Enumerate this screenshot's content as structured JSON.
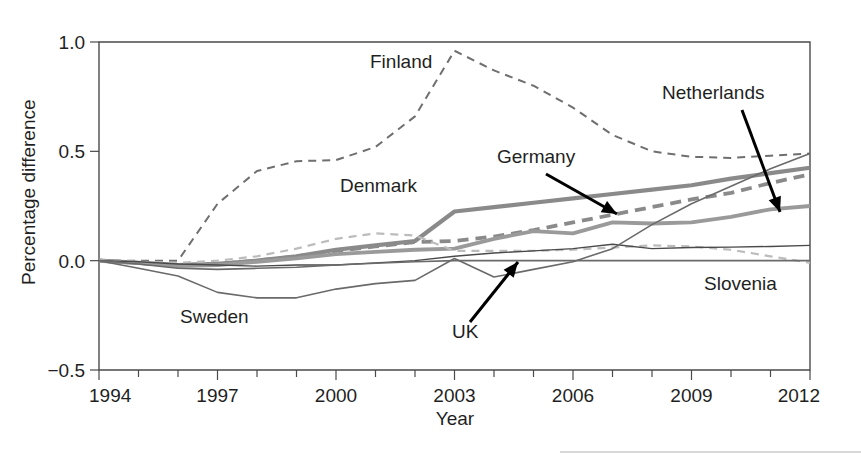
{
  "chart_data": {
    "type": "line",
    "title": "",
    "xlabel": "Year",
    "ylabel": "Percentage difference",
    "xlim": [
      1994,
      2012
    ],
    "ylim": [
      -0.5,
      1.0
    ],
    "grid": false,
    "legend_position": "inline-annotations",
    "x_ticks_major": [
      1994,
      1997,
      2000,
      2003,
      2006,
      2009,
      2012
    ],
    "x_tick_labels": [
      "1994",
      "1997",
      "2000",
      "2003",
      "2006",
      "2009",
      "2012"
    ],
    "x_ticks_minor": [
      1995,
      1996,
      1998,
      1999,
      2001,
      2002,
      2004,
      2005,
      2007,
      2008,
      2010,
      2011
    ],
    "y_ticks": [
      -0.5,
      0.0,
      0.5,
      1.0
    ],
    "y_tick_labels": [
      "−0.5",
      "0.0",
      "0.5",
      "1.0"
    ],
    "x": [
      1994,
      1995,
      1996,
      1997,
      1998,
      1999,
      2000,
      2001,
      2002,
      2003,
      2004,
      2005,
      2006,
      2007,
      2008,
      2009,
      2010,
      2011,
      2012
    ],
    "series": [
      {
        "name": "Finland",
        "style": "dashed",
        "color": "#6f6f6f",
        "width": 2.0,
        "values": [
          0.0,
          0.0,
          0.0,
          0.26,
          0.41,
          0.455,
          0.46,
          0.52,
          0.66,
          0.96,
          0.87,
          0.8,
          0.7,
          0.575,
          0.5,
          0.475,
          0.47,
          0.48,
          0.49
        ]
      },
      {
        "name": "Germany",
        "style": "solid",
        "color": "#8a8a8a",
        "width": 4.2,
        "values": [
          0.0,
          -0.01,
          -0.02,
          -0.015,
          0.0,
          0.02,
          0.05,
          0.07,
          0.09,
          0.225,
          0.245,
          0.265,
          0.285,
          0.305,
          0.325,
          0.345,
          0.375,
          0.4,
          0.425
        ]
      },
      {
        "name": "Netherlands",
        "style": "dashed",
        "color": "#8a8a8a",
        "width": 3.8,
        "values": [
          0.0,
          -0.01,
          -0.02,
          -0.015,
          0.0,
          0.02,
          0.045,
          0.065,
          0.085,
          0.09,
          0.11,
          0.14,
          0.175,
          0.21,
          0.245,
          0.28,
          0.31,
          0.355,
          0.395
        ]
      },
      {
        "name": "Netherlands-lower",
        "style": "solid",
        "color": "#9a9a9a",
        "width": 3.8,
        "values": [
          0.0,
          -0.01,
          -0.025,
          -0.02,
          -0.005,
          0.01,
          0.03,
          0.04,
          0.05,
          0.055,
          0.1,
          0.135,
          0.125,
          0.175,
          0.17,
          0.175,
          0.2,
          0.235,
          0.25
        ]
      },
      {
        "name": "Denmark",
        "style": "dashed",
        "color": "#bcbcbc",
        "width": 2.2,
        "values": [
          0.0,
          -0.005,
          -0.01,
          0.0,
          0.02,
          0.055,
          0.1,
          0.125,
          0.115,
          0.045,
          0.045,
          0.045,
          0.05,
          0.06,
          0.07,
          0.065,
          0.05,
          0.02,
          -0.01
        ]
      },
      {
        "name": "Slovenia",
        "style": "solid",
        "color": "#4a4a4a",
        "width": 1.4,
        "values": [
          0.0,
          -0.005,
          -0.015,
          -0.02,
          -0.025,
          -0.02,
          -0.02,
          -0.01,
          0.0,
          0.02,
          0.035,
          0.045,
          0.055,
          0.075,
          0.055,
          0.06,
          0.062,
          0.065,
          0.07
        ]
      },
      {
        "name": "UK",
        "style": "solid",
        "color": "#6a6a6a",
        "width": 1.6,
        "values": [
          0.0,
          -0.035,
          -0.07,
          -0.145,
          -0.17,
          -0.17,
          -0.13,
          -0.105,
          -0.09,
          0.01,
          -0.075,
          -0.04,
          -0.005,
          0.055,
          0.165,
          0.26,
          0.34,
          0.42,
          0.49
        ]
      },
      {
        "name": "Sweden",
        "style": "solid",
        "color": "#6a6a6a",
        "width": 1.6,
        "values": [
          0.0,
          -0.015,
          -0.035,
          -0.04,
          -0.035,
          -0.03,
          -0.02,
          -0.012,
          -0.005,
          0.0,
          0.0,
          0.0,
          0.0,
          0.0,
          0.0,
          0.0,
          0.0,
          0.0,
          0.0
        ]
      }
    ],
    "annotations": [
      {
        "text": "Finland",
        "x": 370,
        "y": 68,
        "arrow": false
      },
      {
        "text": "Denmark",
        "x": 340,
        "y": 192,
        "arrow": false
      },
      {
        "text": "Germany",
        "x": 497,
        "y": 163,
        "arrow": true,
        "ax1": 546,
        "ay1": 174,
        "ax2": 617,
        "ay2": 214
      },
      {
        "text": "Netherlands",
        "x": 662,
        "y": 99,
        "arrow": true,
        "ax1": 742,
        "ay1": 110,
        "ax2": 780,
        "ay2": 212
      },
      {
        "text": "Sweden",
        "x": 180,
        "y": 323,
        "arrow": false
      },
      {
        "text": "UK",
        "x": 452,
        "y": 338,
        "arrow": true,
        "ax1": 470,
        "ay1": 322,
        "ax2": 518,
        "ay2": 262
      },
      {
        "text": "Slovenia",
        "x": 704,
        "y": 290,
        "arrow": false
      }
    ]
  },
  "axes": {
    "ylabel": "Percentage difference",
    "xlabel": "Year"
  }
}
